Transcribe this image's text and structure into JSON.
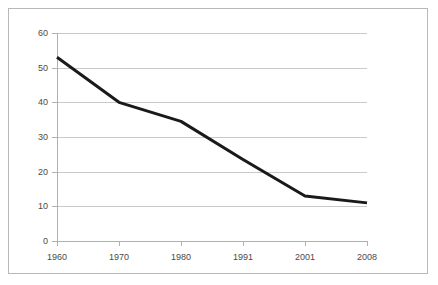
{
  "chart_data": {
    "type": "line",
    "title": "",
    "subtitle": "",
    "xlabel": "",
    "ylabel": "",
    "categories": [
      "1960",
      "1970",
      "1980",
      "1991",
      "2001",
      "2008"
    ],
    "values": [
      53,
      40,
      34.5,
      23.5,
      13,
      11
    ],
    "series": [
      {
        "name": "",
        "values": [
          53,
          40,
          34.5,
          23.5,
          13,
          11
        ],
        "color": "#1a1a1a",
        "line_width": 3,
        "markers": false
      }
    ],
    "ylim": [
      0,
      60
    ],
    "ytick_labels": [
      "0",
      "10",
      "20",
      "30",
      "40",
      "50",
      "60"
    ],
    "ytick_values": [
      0,
      10,
      20,
      30,
      40,
      50,
      60
    ],
    "xtick_labels": [
      "1960",
      "1970",
      "1980",
      "1991",
      "2001",
      "2008"
    ],
    "grid": {
      "horizontal": true,
      "vertical": false,
      "color": "#c9c9c9"
    },
    "legend": {
      "visible": false,
      "position": "none",
      "entries": []
    },
    "annotations": [],
    "colors": {
      "line": "#1a1a1a",
      "grid": "#c9c9c9",
      "axis": "#b0b0b0",
      "tick_label": "#4a4a4a",
      "frame_border": "#b8b8b8",
      "background": "#ffffff"
    }
  }
}
